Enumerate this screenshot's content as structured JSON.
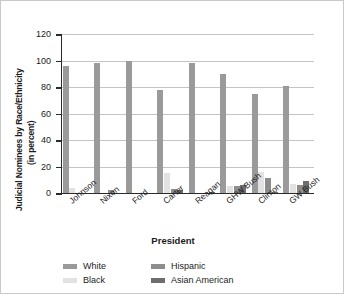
{
  "chart_data": {
    "type": "bar",
    "title": "",
    "xlabel": "President",
    "ylabel": "Judicial Nominees by Race/Ethnicity (in percent)",
    "ylabel_line1": "Judicial Nominees by Race/Ethnicity",
    "ylabel_line2": "(in percent)",
    "ylim": [
      0,
      120
    ],
    "yticks": [
      0,
      20,
      40,
      60,
      80,
      100,
      120
    ],
    "ytick_labels": [
      "0",
      "20",
      "40",
      "60",
      "80",
      "100",
      "120"
    ],
    "grid": "horizontal",
    "legend_position": "below",
    "categories": [
      "Johnson",
      "Nixon",
      "Ford",
      "Carter",
      "Reagan",
      "GHW Bush",
      "Clinton",
      "GW Bush"
    ],
    "series": [
      {
        "name": "White",
        "color": "#9a9a9a",
        "values": [
          96,
          98,
          100,
          78,
          98,
          90,
          75,
          81
        ]
      },
      {
        "name": "Black",
        "color": "#e2e2e2",
        "values": [
          4,
          0,
          0,
          15,
          0,
          5,
          16,
          7
        ]
      },
      {
        "name": "Hispanic",
        "color": "#8d8d8d",
        "values": [
          0,
          2,
          0,
          3,
          0,
          5,
          11,
          6
        ]
      },
      {
        "name": "Asian American",
        "color": "#6e6e6e",
        "values": [
          0,
          0,
          0,
          2,
          1,
          6,
          1,
          9
        ]
      }
    ]
  },
  "legend": {
    "items": [
      {
        "label": "White"
      },
      {
        "label": "Hispanic"
      },
      {
        "label": "Black"
      },
      {
        "label": "Asian American"
      }
    ]
  }
}
